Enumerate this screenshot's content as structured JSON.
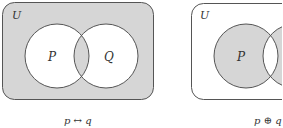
{
  "diagrams": [
    {
      "universe_label": "U",
      "set_p_label": "P",
      "set_q_label": "Q",
      "caption": "p ↔ q",
      "shaded": "complement of symmetric difference"
    },
    {
      "universe_label": "U",
      "set_p_label": "P",
      "set_q_label": "Q",
      "caption": "p ⊕ q",
      "shaded": "symmetric difference"
    }
  ],
  "colors": {
    "shade": "#d6d6d6",
    "stroke": "#555555",
    "background": "#ffffff"
  }
}
